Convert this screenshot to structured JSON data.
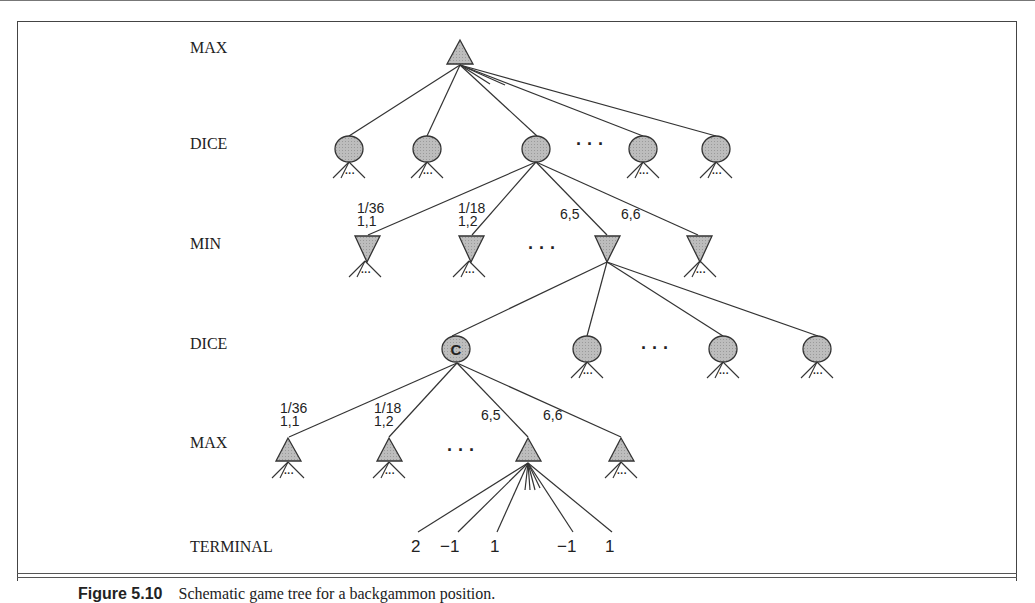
{
  "figure": {
    "level_labels": [
      "MAX",
      "DICE",
      "MIN",
      "DICE",
      "MAX",
      "TERMINAL"
    ],
    "chance_node_label": "C",
    "ellipsis": "· · ·",
    "subtree_ellipsis": "···",
    "edge_labels_min": [
      {
        "prob": "1/36",
        "roll": "1,1"
      },
      {
        "prob": "1/18",
        "roll": "1,2"
      },
      {
        "prob": "",
        "roll": "6,5"
      },
      {
        "prob": "",
        "roll": "6,6"
      }
    ],
    "edge_labels_max": [
      {
        "prob": "1/36",
        "roll": "1,1"
      },
      {
        "prob": "1/18",
        "roll": "1,2"
      },
      {
        "prob": "",
        "roll": "6,5"
      },
      {
        "prob": "",
        "roll": "6,6"
      }
    ],
    "terminal_values": [
      "2",
      "−1",
      "1",
      "−1",
      "1"
    ],
    "colors": {
      "node_fill": "#b5b5b5",
      "stroke": "#333333"
    }
  },
  "caption": {
    "label": "Figure 5.10",
    "text": "Schematic game tree for a backgammon position."
  }
}
